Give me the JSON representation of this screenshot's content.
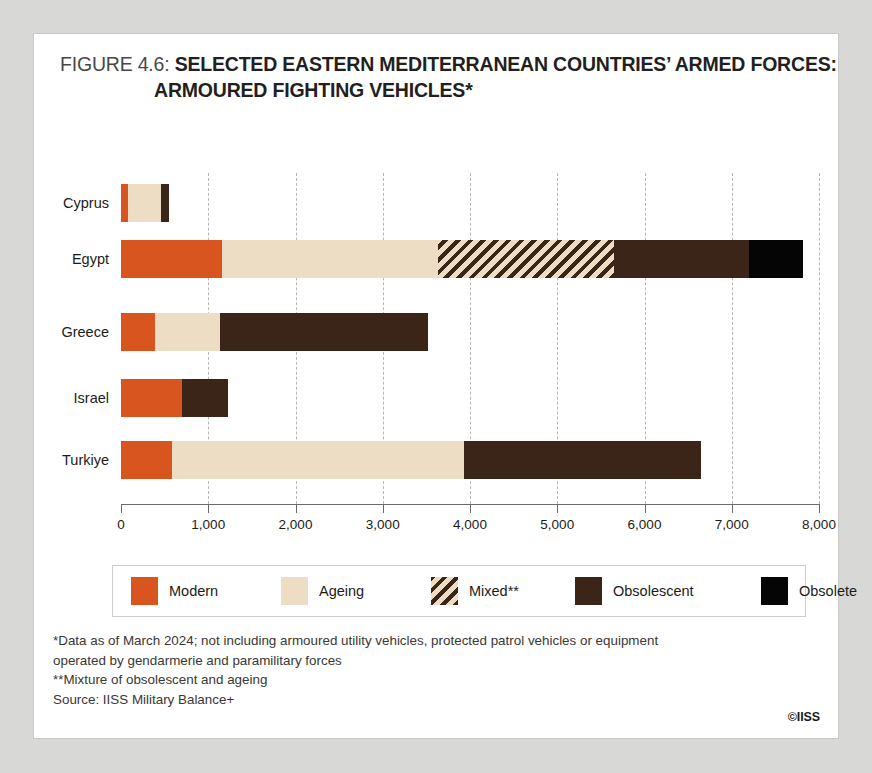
{
  "figure": {
    "number_label": "FIGURE 4.6:",
    "title_line_1": "SELECTED EASTERN MEDITERRANEAN COUNTRIES’ ARMED FORCES:",
    "title_line_2": "ARMOURED FIGHTING VEHICLES*"
  },
  "footnotes": {
    "line_1": "*Data as of March 2024; not including armoured utility vehicles, protected patrol vehicles or equipment",
    "line_2": "operated by gendarmerie and paramilitary forces",
    "line_3": "**Mixture of obsolescent and ageing",
    "line_4": "Source: IISS Military Balance+"
  },
  "copyright": "©IISS",
  "colors": {
    "modern": "#d9551f",
    "ageing": "#ecddc4",
    "mixed_base": "#ecddc4",
    "mixed_stripe": "#3b2418",
    "obsolescent": "#3b2418",
    "obsolete": "#050505",
    "axis": "#6d6a67",
    "grid": "#b9b7b4",
    "card_background": "#ffffff",
    "page_background": "#d8d8d6"
  },
  "chart_data": {
    "type": "bar",
    "orientation": "horizontal",
    "stacked": true,
    "title": "FIGURE 4.6: SELECTED EASTERN MEDITERRANEAN COUNTRIES’ ARMED FORCES: ARMOURED FIGHTING VEHICLES*",
    "xlabel": "",
    "ylabel": "",
    "xlim": [
      0,
      8000
    ],
    "xticks": [
      0,
      1000,
      2000,
      3000,
      4000,
      5000,
      6000,
      7000,
      8000
    ],
    "xticklabels": [
      "0",
      "1,000",
      "2,000",
      "3,000",
      "4,000",
      "5,000",
      "6,000",
      "7,000",
      "8,000"
    ],
    "grid": true,
    "grid_axis": "x",
    "legend_position": "bottom",
    "categories": [
      "Cyprus",
      "Egypt",
      "Greece",
      "Israel",
      "Turkiye"
    ],
    "series": [
      {
        "name": "Modern",
        "values": [
          80,
          1160,
          390,
          700,
          580
        ]
      },
      {
        "name": "Ageing",
        "values": [
          380,
          2470,
          740,
          0,
          3350
        ]
      },
      {
        "name": "Mixed**",
        "values": [
          0,
          2020,
          0,
          0,
          0
        ]
      },
      {
        "name": "Obsolescent",
        "values": [
          90,
          1550,
          2390,
          530,
          2720
        ]
      },
      {
        "name": "Obsolete",
        "values": [
          0,
          620,
          0,
          0,
          0
        ]
      }
    ],
    "totals": [
      550,
      7820,
      3520,
      1230,
      6650
    ]
  },
  "legend": {
    "items": [
      {
        "label": "Modern",
        "key": "modern"
      },
      {
        "label": "Ageing",
        "key": "ageing"
      },
      {
        "label": "Mixed**",
        "key": "mixed"
      },
      {
        "label": "Obsolescent",
        "key": "obsolescent"
      },
      {
        "label": "Obsolete",
        "key": "obsolete"
      }
    ]
  }
}
